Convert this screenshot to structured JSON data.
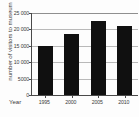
{
  "chart_data": {
    "type": "bar",
    "title": "",
    "subtitle": "",
    "xlabel": "Year",
    "ylabel": "number of visitors to museum",
    "categories": [
      "1995",
      "2000",
      "2005",
      "2010"
    ],
    "values": [
      15000,
      18500,
      22500,
      21000
    ],
    "series": [
      {
        "name": "number of visitors to museum",
        "values": [
          15000,
          18500,
          22500,
          21000
        ]
      }
    ],
    "ylim": [
      0,
      25000
    ],
    "ytick_values": [
      0,
      5000,
      10000,
      15000,
      20000,
      25000
    ],
    "ytick_labels": [
      "0",
      "5000",
      "10 000",
      "15 000",
      "20 000",
      "25 000"
    ],
    "grid": true,
    "grid_axis": "y",
    "legend": false,
    "legend_position": "none",
    "bar_color": "#101010",
    "grid_color": "#b9b9b9",
    "axis_color": "#4a4a4a",
    "annotations": []
  }
}
